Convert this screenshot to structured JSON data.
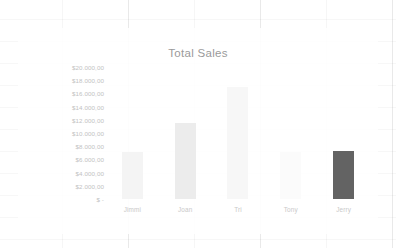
{
  "chart_data": {
    "type": "bar",
    "title": "Total Sales",
    "xlabel": "",
    "ylabel": "",
    "categories": [
      "Jimmi",
      "Joan",
      "Tri",
      "Tony",
      "Jerry"
    ],
    "values": [
      7300,
      11800,
      17500,
      7300,
      7500
    ],
    "ylim": [
      0,
      20000
    ],
    "ytick_values": [
      20000,
      18000,
      16000,
      14000,
      12000,
      10000,
      8000,
      6000,
      4000,
      2000,
      0
    ],
    "ytick_labels": [
      "$20.000,00",
      "$18.000,00",
      "$16.000,00",
      "$14.000,00",
      "$12.000,00",
      "$10.000,00",
      "$8.000,00",
      "$6.000,00",
      "$4.000,00",
      "$2.000,00",
      "$  -"
    ],
    "grid": false,
    "legend": false,
    "bar_colors": [
      "#f4f4f4",
      "#ececec",
      "#f7f7f7",
      "#fbfbfb",
      "#636363"
    ],
    "title_color": "#9a9a9a",
    "tick_color": "#c2c2c2"
  },
  "background": {
    "name": "spreadsheet-grid-watermark"
  }
}
